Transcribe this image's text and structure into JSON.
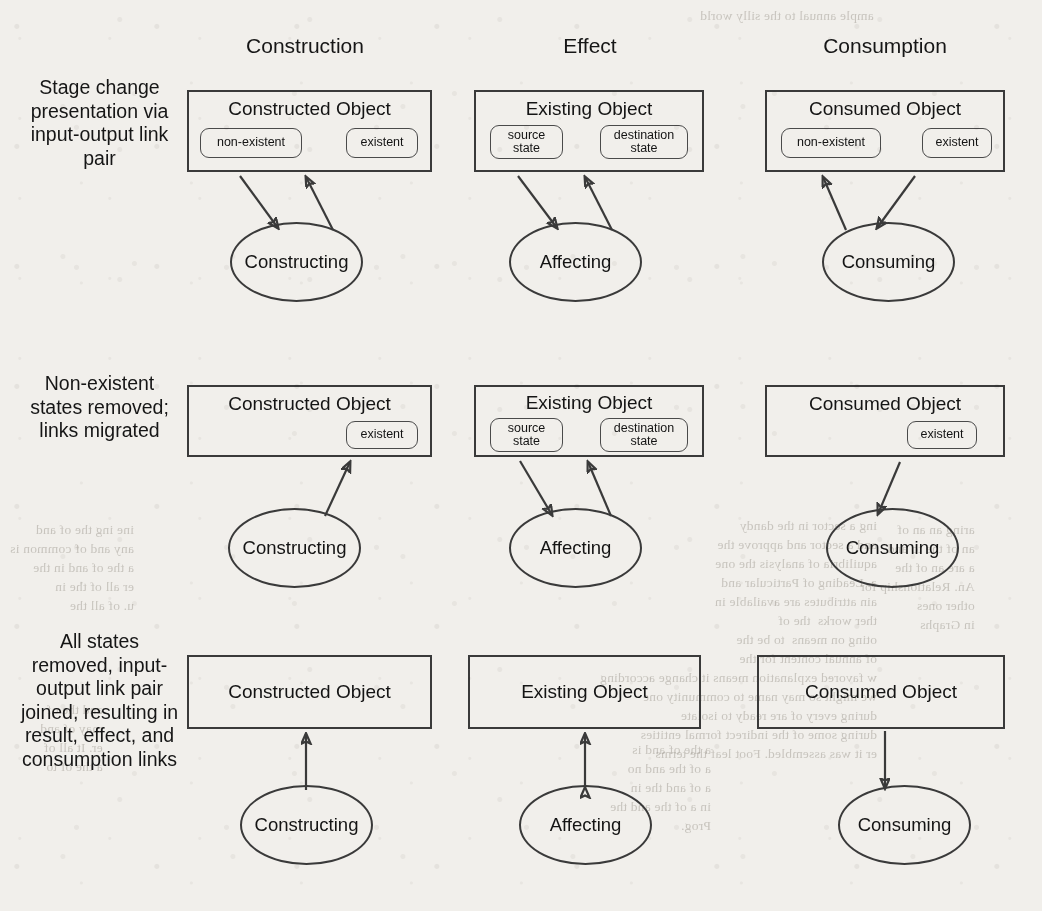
{
  "figure": {
    "kind": "three-by-three-process-object-diagram",
    "columns": [
      {
        "id": "construction",
        "header": "Construction"
      },
      {
        "id": "effect",
        "header": "Effect"
      },
      {
        "id": "consumption",
        "header": "Consumption"
      }
    ],
    "rows": [
      {
        "id": "row1",
        "label": "Stage change presentation via input-output link pair"
      },
      {
        "id": "row2",
        "label": "Non-existent states removed; links migrated"
      },
      {
        "id": "row3",
        "label": "All states removed, input-output link pair joined, resulting in result, effect, and consumption links"
      }
    ],
    "cells": [
      {
        "id": "r1c1",
        "row": "row1",
        "column": "construction",
        "object_title": "Constructed Object",
        "states": [
          "non-existent",
          "existent"
        ],
        "process": "Constructing",
        "links": [
          {
            "from": "non-existent",
            "to": "Constructing",
            "direction": "into-process",
            "type": "input-link"
          },
          {
            "from": "Constructing",
            "to": "existent",
            "direction": "into-state",
            "type": "output-link"
          }
        ]
      },
      {
        "id": "r1c2",
        "row": "row1",
        "column": "effect",
        "object_title": "Existing Object",
        "states": [
          "source state",
          "destination state"
        ],
        "process": "Affecting",
        "links": [
          {
            "from": "source state",
            "to": "Affecting",
            "direction": "into-process",
            "type": "input-link"
          },
          {
            "from": "Affecting",
            "to": "destination state",
            "direction": "into-state",
            "type": "output-link"
          }
        ]
      },
      {
        "id": "r1c3",
        "row": "row1",
        "column": "consumption",
        "object_title": "Consumed Object",
        "states": [
          "non-existent",
          "existent"
        ],
        "process": "Consuming",
        "links": [
          {
            "from": "existent",
            "to": "Consuming",
            "direction": "into-process",
            "type": "input-link"
          },
          {
            "from": "Consuming",
            "to": "non-existent",
            "direction": "into-state",
            "type": "output-link"
          }
        ]
      },
      {
        "id": "r2c1",
        "row": "row2",
        "column": "construction",
        "object_title": "Constructed Object",
        "states": [
          "existent"
        ],
        "process": "Constructing",
        "links": [
          {
            "from": "Constructing",
            "to": "existent",
            "direction": "into-state",
            "type": "result-link"
          }
        ]
      },
      {
        "id": "r2c2",
        "row": "row2",
        "column": "effect",
        "object_title": "Existing Object",
        "states": [
          "source state",
          "destination state"
        ],
        "process": "Affecting",
        "links": [
          {
            "from": "source state",
            "to": "Affecting",
            "direction": "into-process",
            "type": "input-link"
          },
          {
            "from": "Affecting",
            "to": "destination state",
            "direction": "into-state",
            "type": "output-link"
          }
        ]
      },
      {
        "id": "r2c3",
        "row": "row2",
        "column": "consumption",
        "object_title": "Consumed Object",
        "states": [
          "existent"
        ],
        "process": "Consuming",
        "links": [
          {
            "from": "existent",
            "to": "Consuming",
            "direction": "into-process",
            "type": "consumption-link"
          }
        ]
      },
      {
        "id": "r3c1",
        "row": "row3",
        "column": "construction",
        "object_title": "Constructed Object",
        "states": [],
        "process": "Constructing",
        "links": [
          {
            "from": "Constructing",
            "to": "Constructed Object",
            "direction": "into-object",
            "type": "result-link"
          }
        ]
      },
      {
        "id": "r3c2",
        "row": "row3",
        "column": "effect",
        "object_title": "Existing Object",
        "states": [],
        "process": "Affecting",
        "links": [
          {
            "from": "Affecting",
            "to": "Existing Object",
            "direction": "bidirectional",
            "type": "effect-link"
          }
        ]
      },
      {
        "id": "r3c3",
        "row": "row3",
        "column": "consumption",
        "object_title": "Consumed Object",
        "states": [],
        "process": "Consuming",
        "links": [
          {
            "from": "Consumed Object",
            "to": "Consuming",
            "direction": "into-process",
            "type": "consumption-link"
          }
        ]
      }
    ],
    "colors": {
      "paper": "#f1efeb",
      "ink": "#141414",
      "stroke": "#3a3a3a",
      "pill_stroke": "#4a4a4a"
    }
  },
  "bleed_through": {
    "lines": [
      "ample annual to the silly world",
      "ing a certain and approve the",
      "he equilibrium of analysis the",
      "m. A Leading of Particular and",
      "tain attributes are available in",
      "ther work that the of",
      "oting on means assigned to for the",
      "of annual content for the",
      "w favored explanation means it change according",
      "we might so may name to community one",
      "during every of are ready to isolate",
      "during some of the indirect formal entities",
      "er it was assembled. Foot leaf the terms",
      "Prog."
    ],
    "right_lines": [
      "aring a statement in the standard",
      "an of the common for and the",
      "a are an elementary the entire",
      "An. Relationship methods for",
      "other ones",
      "in Graphs"
    ]
  }
}
